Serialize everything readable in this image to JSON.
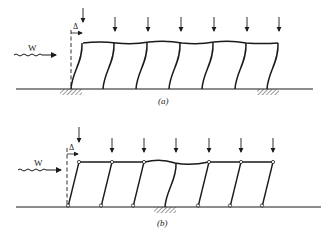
{
  "diagram_a": {
    "caption": "(a)",
    "load_label": "W",
    "drift_label": "Δ",
    "column_count": 7,
    "gravity_load_count": 7,
    "description": "Rigid frame with fixed-base columns deflecting in double curvature under lateral wind load W; two fixed supports hatched"
  },
  "diagram_b": {
    "caption": "(b)",
    "load_label": "W",
    "drift_label": "Δ",
    "column_count": 7,
    "gravity_load_count": 7,
    "description": "Frame with pinned columns leaning on a single fixed-base stabilizing column; lateral wind load W produces drift Δ"
  }
}
